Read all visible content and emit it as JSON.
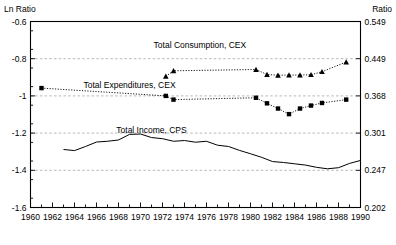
{
  "chart_data": {
    "type": "line",
    "title": "",
    "ylabel": "Ln Ratio",
    "ylabel_right": "Ratio",
    "xlabel": "",
    "xlim": [
      1960,
      1990
    ],
    "ylim": [
      -1.6,
      -0.6
    ],
    "grid": true,
    "legend_position": "inline-annotations",
    "y_ticks": [
      -0.6,
      -0.8,
      -1,
      -1.2,
      -1.4,
      -1.6
    ],
    "y_tick_labels": [
      "-0.6",
      "-0.8",
      "-1",
      "-1.2",
      "-1.4",
      "-1.6"
    ],
    "y_ticks_right": [
      0.549,
      0.449,
      0.368,
      0.301,
      0.247,
      0.202
    ],
    "y_tick_labels_right": [
      "0.549",
      "0.449",
      "0.368",
      "0.301",
      "0.247",
      "0.202"
    ],
    "x_ticks": [
      1960,
      1961,
      1962,
      1963,
      1964,
      1965,
      1966,
      1967,
      1968,
      1969,
      1970,
      1971,
      1972,
      1973,
      1974,
      1975,
      1976,
      1977,
      1978,
      1979,
      1980,
      1981,
      1982,
      1983,
      1984,
      1985,
      1986,
      1987,
      1988,
      1989,
      1990
    ],
    "x_tick_labels": [
      "1960",
      "1962",
      "1964",
      "1966",
      "1968",
      "1970",
      "1972",
      "1974",
      "1976",
      "1978",
      "1980",
      "1982",
      "1984",
      "1986",
      "1988",
      "1990"
    ],
    "x_tick_label_years": [
      1960,
      1962,
      1964,
      1966,
      1968,
      1970,
      1972,
      1974,
      1976,
      1978,
      1980,
      1982,
      1984,
      1986,
      1988,
      1990
    ],
    "gridline_values": [
      -0.8,
      -1,
      -1.2,
      -1.4
    ],
    "series": [
      {
        "name": "Total Consumption, CEX",
        "marker": "triangle",
        "linestyle": "dotted",
        "label_x": 1975.4,
        "label_y": -0.745,
        "x": [
          1972.3,
          1973.0,
          1980.5,
          1981.5,
          1982.5,
          1983.5,
          1984.5,
          1985.5,
          1986.5,
          1988.7
        ],
        "y": [
          -0.895,
          -0.865,
          -0.858,
          -0.885,
          -0.889,
          -0.888,
          -0.888,
          -0.886,
          -0.87,
          -0.818
        ]
      },
      {
        "name": "Total Expenditures, CEX",
        "marker": "square",
        "linestyle": "dotted",
        "label_x": 1969.0,
        "label_y": -0.955,
        "x": [
          1961.0,
          1972.3,
          1973.0,
          1980.5,
          1981.5,
          1982.5,
          1983.5,
          1984.5,
          1985.5,
          1986.5,
          1988.7
        ],
        "y": [
          -0.958,
          -1.0,
          -1.02,
          -1.01,
          -1.04,
          -1.068,
          -1.098,
          -1.068,
          -1.052,
          -1.038,
          -1.02
        ]
      },
      {
        "name": "Total Income, CPS",
        "marker": "none",
        "linestyle": "solid",
        "label_x": 1971.0,
        "label_y": -1.2,
        "x": [
          1963.0,
          1964.0,
          1965.0,
          1966.0,
          1967.0,
          1968.0,
          1969.0,
          1970.0,
          1971.0,
          1972.0,
          1973.0,
          1974.0,
          1975.0,
          1976.0,
          1977.0,
          1978.0,
          1979.0,
          1980.0,
          1981.0,
          1982.0,
          1983.0,
          1984.0,
          1985.0,
          1986.0,
          1987.0,
          1988.0,
          1989.0,
          1990.0
        ],
        "y": [
          -1.288,
          -1.294,
          -1.272,
          -1.248,
          -1.244,
          -1.237,
          -1.207,
          -1.205,
          -1.224,
          -1.23,
          -1.244,
          -1.24,
          -1.249,
          -1.244,
          -1.265,
          -1.272,
          -1.293,
          -1.311,
          -1.33,
          -1.353,
          -1.358,
          -1.365,
          -1.372,
          -1.384,
          -1.392,
          -1.386,
          -1.363,
          -1.347
        ]
      }
    ]
  }
}
